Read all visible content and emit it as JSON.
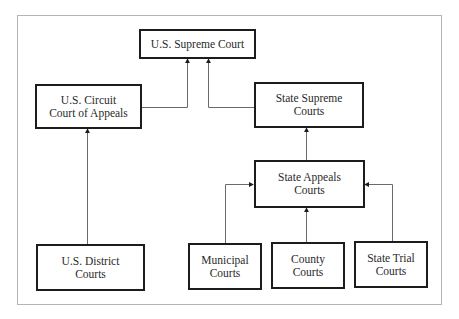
{
  "diagram": {
    "type": "organizational-hierarchy",
    "nodes": {
      "us_supreme_court": {
        "label": "U.S. Supreme Court"
      },
      "us_circuit_court": {
        "label": "U.S. Circuit\nCourt of Appeals"
      },
      "state_supreme_courts": {
        "label": "State Supreme\nCourts"
      },
      "state_appeals_courts": {
        "label": "State Appeals\nCourts"
      },
      "us_district_courts": {
        "label": "U.S. District\nCourts"
      },
      "municipal_courts": {
        "label": "Municipal\nCourts"
      },
      "county_courts": {
        "label": "County\nCourts"
      },
      "state_trial_courts": {
        "label": "State Trial\nCourts"
      }
    },
    "edges": [
      {
        "from": "us_district_courts",
        "to": "us_circuit_court"
      },
      {
        "from": "us_circuit_court",
        "to": "us_supreme_court"
      },
      {
        "from": "state_supreme_courts",
        "to": "us_supreme_court"
      },
      {
        "from": "state_appeals_courts",
        "to": "state_supreme_courts"
      },
      {
        "from": "municipal_courts",
        "to": "state_appeals_courts"
      },
      {
        "from": "county_courts",
        "to": "state_appeals_courts"
      },
      {
        "from": "state_trial_courts",
        "to": "state_appeals_courts"
      }
    ],
    "colors": {
      "box_border": "#1c1c1c",
      "connector": "#6a6a6a",
      "frame": "#b4b4b4",
      "text": "#2a2a2a"
    }
  }
}
